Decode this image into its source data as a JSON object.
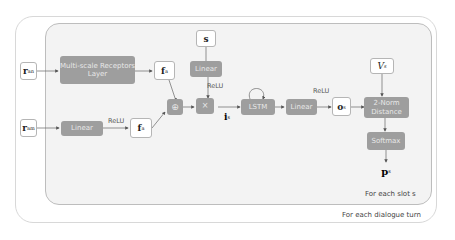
{
  "diagram": {
    "outer_caption": "For each dialogue turn",
    "inner_caption": "For each slot s",
    "inputs": [
      {
        "id": "r_a_n",
        "base": "r",
        "sub": "a",
        "sup": "n"
      },
      {
        "id": "r_a_m",
        "base": "r",
        "sub": "a",
        "sup": "m"
      },
      {
        "id": "s",
        "base": "s"
      },
      {
        "id": "V_s",
        "base": "V",
        "sub": "s"
      }
    ],
    "nodes": {
      "multiscale": "Multi-scale Receptors Layer",
      "linear_a": "Linear",
      "linear_s": "Linear",
      "concat": "⊕",
      "multiply": "×",
      "lstm": "LSTM",
      "linear_o": "Linear",
      "norm": "2-Norm Distance",
      "softmax": "Softmax"
    },
    "variables": {
      "f_a_top": {
        "base": "f",
        "sub": "a"
      },
      "f_a_bottom": {
        "base": "f",
        "sub": "a"
      },
      "i_s": {
        "base": "i",
        "sub": "s"
      },
      "o_s": {
        "base": "o",
        "sub": "s"
      },
      "p_s": {
        "base": "p",
        "sub": "s"
      }
    },
    "edge_labels": {
      "relu_a": "ReLU",
      "relu_s": "ReLU",
      "relu_o": "ReLU"
    }
  }
}
